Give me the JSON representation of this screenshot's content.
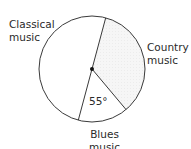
{
  "chart_data": {
    "type": "pie",
    "title": "",
    "categories": [
      "Classical music",
      "Country music",
      "Blues music"
    ],
    "values_degrees": [
      180,
      125,
      55
    ],
    "angle_annotation": "55°",
    "annotated_category": "Blues music",
    "fills": {
      "Classical music": "#ffffff",
      "Country music": "#f4f4f4",
      "Blues music": "#ffffff"
    },
    "stroke_color": "#3a3a3a",
    "center_dot": true,
    "legend": "none (direct labels)"
  },
  "labels": {
    "classical": [
      "Classical",
      "music"
    ],
    "country": [
      "Country",
      "music"
    ],
    "blues": [
      "Blues",
      "music"
    ],
    "angle": "55°"
  }
}
